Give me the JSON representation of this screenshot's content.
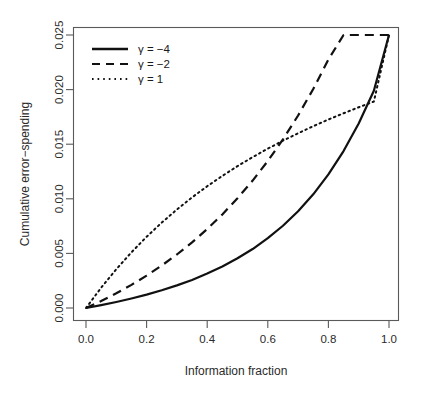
{
  "chart_data": {
    "type": "line",
    "title": "",
    "xlabel": "Information fraction",
    "ylabel": "Cumulative error-spending",
    "xlim": [
      0.0,
      1.0
    ],
    "ylim": [
      0.0,
      0.025
    ],
    "xticks": [
      "0.0",
      "0.2",
      "0.4",
      "0.6",
      "0.8",
      "1.0"
    ],
    "xtick_values": [
      0.0,
      0.2,
      0.4,
      0.6,
      0.8,
      1.0
    ],
    "yticks": [
      "0.000",
      "0.005",
      "0.010",
      "0.015",
      "0.020",
      "0.025"
    ],
    "ytick_values": [
      0.0,
      0.005,
      0.01,
      0.015,
      0.02,
      0.025
    ],
    "grid": false,
    "legend_position": "top-left",
    "x": [
      0.0,
      0.05,
      0.1,
      0.15,
      0.2,
      0.25,
      0.3,
      0.35,
      0.4,
      0.45,
      0.5,
      0.55,
      0.6,
      0.65,
      0.7,
      0.75,
      0.8,
      0.85,
      0.9,
      0.95,
      1.0
    ],
    "series": [
      {
        "name": "γ = −4",
        "linestyle": "solid",
        "color": "#111111",
        "values": [
          0.0,
          0.00026,
          0.00055,
          0.00087,
          0.00122,
          0.00162,
          0.00207,
          0.00257,
          0.00315,
          0.0038,
          0.00455,
          0.0054,
          0.00639,
          0.00753,
          0.00886,
          0.01041,
          0.01223,
          0.01437,
          0.0169,
          0.01989,
          0.025
        ]
      },
      {
        "name": "γ = −2",
        "linestyle": "dashed",
        "color": "#111111",
        "values": [
          0.0,
          0.00064,
          0.00135,
          0.00212,
          0.00296,
          0.00389,
          0.0049,
          0.00601,
          0.00723,
          0.00857,
          0.01005,
          0.01167,
          0.01346,
          0.01544,
          0.01763,
          0.02006,
          0.02275,
          0.02575,
          0.02908,
          0.0328,
          0.025
        ]
      },
      {
        "name": "γ = 1",
        "linestyle": "dotted",
        "color": "#111111",
        "values": [
          0.0,
          0.00186,
          0.00355,
          0.0051,
          0.00652,
          0.00782,
          0.00902,
          0.01013,
          0.01115,
          0.0121,
          0.01299,
          0.01382,
          0.01459,
          0.01532,
          0.016,
          0.01665,
          0.01726,
          0.01783,
          0.01838,
          0.0189,
          0.025
        ]
      }
    ],
    "annotations": []
  },
  "legend": {
    "entries": [
      {
        "label": "γ = −4",
        "style": "solid"
      },
      {
        "label": "γ = −2",
        "style": "dashed"
      },
      {
        "label": "γ = 1",
        "style": "dotted"
      }
    ]
  },
  "axis": {
    "x_title": "Information fraction",
    "y_title": "Cumulative error−spending",
    "x_tick_labels": [
      "0.0",
      "0.2",
      "0.4",
      "0.6",
      "0.8",
      "1.0"
    ],
    "y_tick_labels": [
      "0.000",
      "0.005",
      "0.010",
      "0.015",
      "0.020",
      "0.025"
    ]
  }
}
